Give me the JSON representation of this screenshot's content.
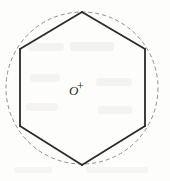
{
  "figure": {
    "caption": "",
    "center_label": "O",
    "center_marker": "+",
    "width": 170,
    "height": 181,
    "background_color": "#fdfdfc",
    "stroke_color": "#2b2b2b",
    "dash_color": "#8b8b8b",
    "ghost_color": "#e3e2e0"
  },
  "chart_data": {
    "type": "diagram",
    "title": "",
    "subtitle": "",
    "xlabel": "",
    "ylabel": "",
    "shapes": [
      {
        "name": "circumscribed-circle",
        "kind": "circle",
        "style": "dashed",
        "stroke": "#8b8b8b",
        "stroke_width": 1,
        "dash_pattern": "4 3",
        "cx": 82,
        "cy": 88,
        "r": 76
      },
      {
        "name": "regular-hexagon",
        "kind": "polygon",
        "style": "solid",
        "stroke": "#2b2b2b",
        "stroke_width": 1.8,
        "fill": "none",
        "sides": 6,
        "orientation": "pointy-top",
        "points": [
          [
            82,
            12
          ],
          [
            145,
            49
          ],
          [
            145,
            126
          ],
          [
            82,
            165
          ],
          [
            20,
            126
          ],
          [
            20,
            49
          ]
        ]
      },
      {
        "name": "center-point",
        "kind": "point",
        "label": "O",
        "marker": "+",
        "cx": 82,
        "cy": 88
      }
    ],
    "annotations": [
      {
        "name": "center-label",
        "text": "O",
        "x": 73,
        "y": 91
      },
      {
        "name": "center-cross",
        "text": "+",
        "x": 82,
        "y": 88
      }
    ],
    "grid": false,
    "legend": null
  },
  "ghost_text": [
    {
      "text": "",
      "x": 22,
      "y": 48,
      "size": 11,
      "spacing": 3
    },
    {
      "text": "",
      "x": 60,
      "y": 52,
      "size": 12,
      "spacing": 3
    },
    {
      "text": "",
      "x": 30,
      "y": 80,
      "size": 11,
      "spacing": 3
    },
    {
      "text": "",
      "x": 95,
      "y": 84,
      "size": 11,
      "spacing": 3
    },
    {
      "text": "",
      "x": 26,
      "y": 108,
      "size": 11,
      "spacing": 3
    },
    {
      "text": "",
      "x": 100,
      "y": 112,
      "size": 11,
      "spacing": 3
    },
    {
      "text": "",
      "x": 20,
      "y": 172,
      "size": 9,
      "spacing": 3
    },
    {
      "text": "",
      "x": 92,
      "y": 172,
      "size": 9,
      "spacing": 3
    }
  ]
}
